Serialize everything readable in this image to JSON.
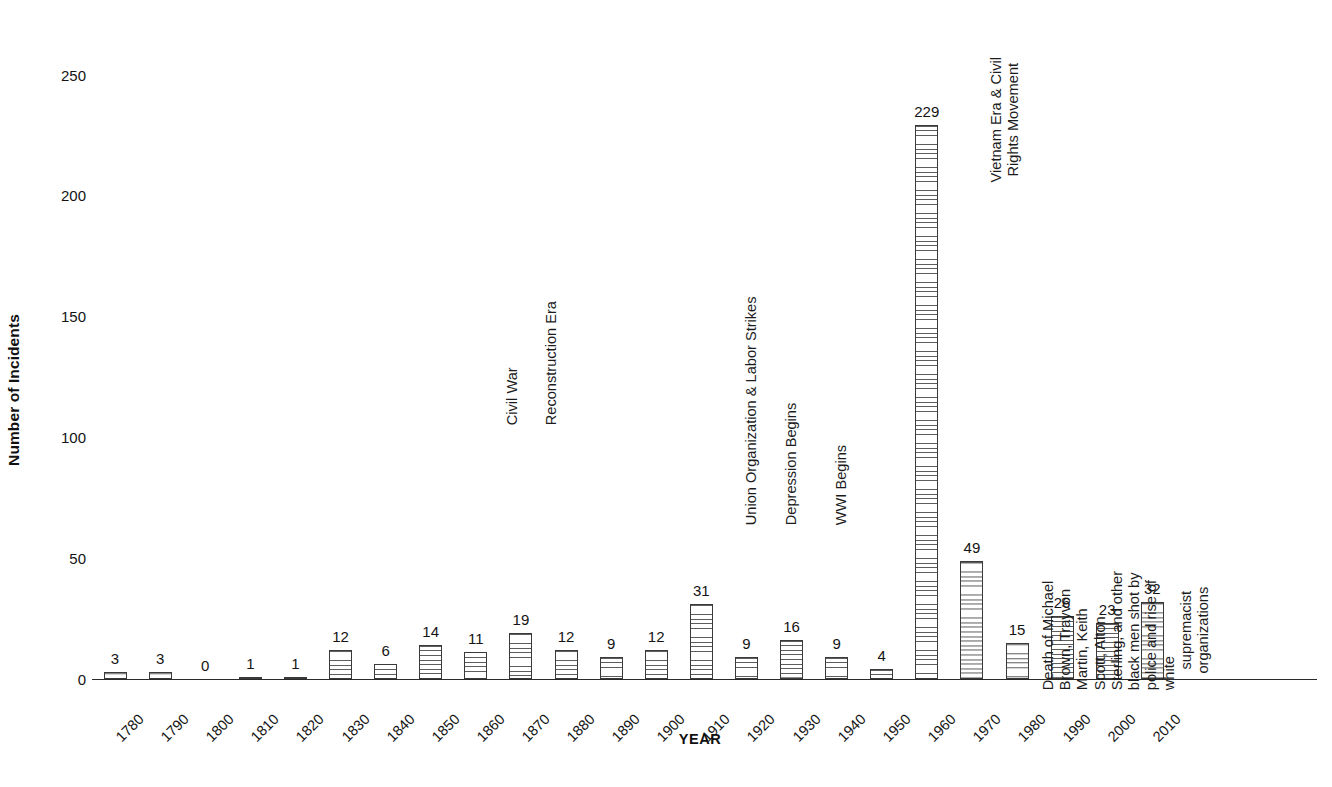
{
  "chart_data": {
    "type": "bar",
    "title": "",
    "xlabel": "YEAR",
    "ylabel": "Number of Incidents",
    "ylim": [
      0,
      250
    ],
    "yticks": [
      0,
      50,
      100,
      150,
      200,
      250
    ],
    "grid": false,
    "legend": null,
    "categories": [
      "1780",
      "1790",
      "1800",
      "1810",
      "1820",
      "1830",
      "1840",
      "1850",
      "1860",
      "1870",
      "1880",
      "1890",
      "1900",
      "1910",
      "1920",
      "1930",
      "1940",
      "1950",
      "1960",
      "1970",
      "1980",
      "1990",
      "2000",
      "2010"
    ],
    "values": [
      3,
      3,
      0,
      1,
      1,
      12,
      6,
      14,
      11,
      19,
      12,
      9,
      12,
      31,
      9,
      16,
      9,
      4,
      229,
      49,
      15,
      26,
      23,
      32
    ],
    "data_labels": [
      "3",
      "3",
      "0",
      "1",
      "1",
      "12",
      "6",
      "14",
      "11",
      "19",
      "12",
      "9",
      "12",
      "31",
      "9",
      "16",
      "9",
      "4",
      "229",
      "49",
      "15",
      "26",
      "23",
      "32"
    ],
    "bar_style": "horizontal-hatch",
    "annotations": [
      {
        "id": "civil-war",
        "category": "1860",
        "lines": [
          "Civil War"
        ],
        "orientation": "vertical"
      },
      {
        "id": "reconstruction-era",
        "category": "1870",
        "lines": [
          "Reconstruction Era"
        ],
        "orientation": "vertical"
      },
      {
        "id": "union-organization",
        "category": "1910",
        "lines": [
          "Union Organization & Labor Strikes"
        ],
        "orientation": "vertical"
      },
      {
        "id": "depression-begins",
        "category": "1920",
        "lines": [
          "Depression Begins"
        ],
        "orientation": "vertical"
      },
      {
        "id": "wwi-begins",
        "category": "1930",
        "lines": [
          "WWI Begins"
        ],
        "orientation": "vertical"
      },
      {
        "id": "vietnam-era",
        "category": "1960",
        "lines": [
          "Vietnam Era & Civil",
          "Rights Movement"
        ],
        "orientation": "vertical"
      },
      {
        "id": "police-shootings",
        "category": "2010",
        "lines": [
          "Death of Michael Brown, Trayvon Martin, Keith Scott, Alton",
          "Sterling, and other black men shot by police and rise of white",
          "supremacist organizations"
        ],
        "orientation": "vertical"
      }
    ],
    "colors": {
      "axis": "#2b2b2b",
      "bar_edge": "#3a3a3a",
      "bar_hatch": "#5d5d5d",
      "bar_fill": "#ffffff",
      "text": "#141414",
      "background": "#ffffff"
    }
  },
  "layout": {
    "axis_y_px": 679,
    "axis_left_px": 92,
    "axis_right_px": 1317,
    "first_bar_center_px": 115,
    "bar_spacing_px": 45.1,
    "bar_width_px": 23,
    "px_per_unit": 2.418
  }
}
